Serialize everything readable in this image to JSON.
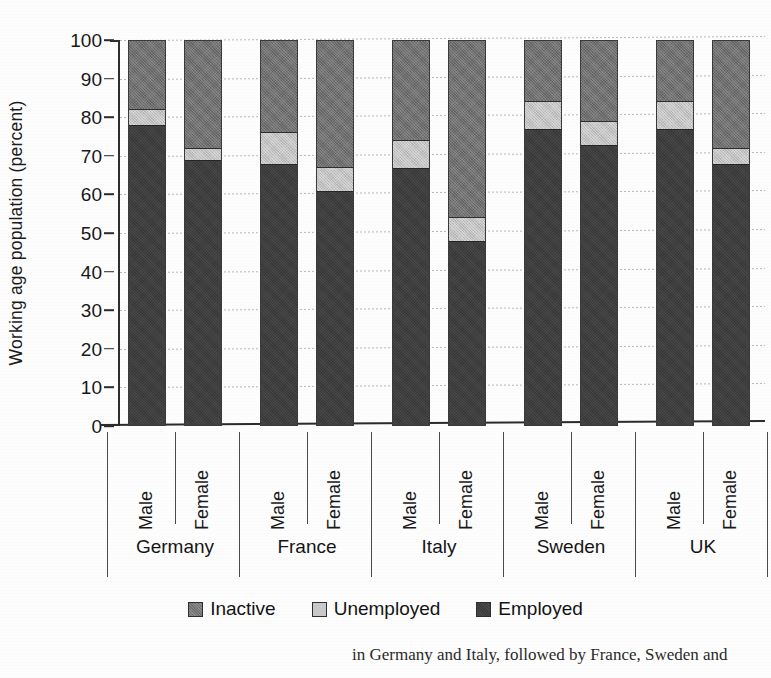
{
  "chart_data": {
    "type": "bar",
    "subtype": "stacked-100-percent",
    "title": "",
    "xlabel": "",
    "ylabel": "Working age population (percent)",
    "ylim": [
      0,
      100
    ],
    "ytick_values": [
      0,
      10,
      20,
      30,
      40,
      50,
      60,
      70,
      80,
      90,
      100
    ],
    "ytick_labels": [
      "0",
      "10",
      "20",
      "30",
      "40",
      "50",
      "60",
      "70",
      "80",
      "90",
      "100"
    ],
    "grid": true,
    "grid_axis": "y",
    "legend_position": "bottom",
    "groups": [
      "Germany",
      "France",
      "Italy",
      "Sweden",
      "UK"
    ],
    "subcategories": [
      "Male",
      "Female"
    ],
    "categories": [
      "Germany Male",
      "Germany Female",
      "France Male",
      "France Female",
      "Italy Male",
      "Italy Female",
      "Sweden Male",
      "Sweden Female",
      "UK Male",
      "UK Female"
    ],
    "series": [
      {
        "name": "Employed",
        "color": "#3d3d3d",
        "values": [
          78,
          69,
          68,
          61,
          67,
          48,
          77,
          73,
          77,
          68
        ]
      },
      {
        "name": "Unemployed",
        "color": "#c2c2c2",
        "values": [
          4,
          3,
          8,
          6,
          7,
          6,
          7,
          6,
          7,
          4
        ]
      },
      {
        "name": "Inactive",
        "color": "#707070",
        "values": [
          18,
          28,
          24,
          33,
          26,
          46,
          16,
          21,
          16,
          28
        ]
      }
    ],
    "bars": [
      {
        "group": "Germany",
        "sex": "Male",
        "employed": 78,
        "unemployed": 4,
        "inactive": 18
      },
      {
        "group": "Germany",
        "sex": "Female",
        "employed": 69,
        "unemployed": 3,
        "inactive": 28
      },
      {
        "group": "France",
        "sex": "Male",
        "employed": 68,
        "unemployed": 8,
        "inactive": 24
      },
      {
        "group": "France",
        "sex": "Female",
        "employed": 61,
        "unemployed": 6,
        "inactive": 33
      },
      {
        "group": "Italy",
        "sex": "Male",
        "employed": 67,
        "unemployed": 7,
        "inactive": 26
      },
      {
        "group": "Italy",
        "sex": "Female",
        "employed": 48,
        "unemployed": 6,
        "inactive": 46
      },
      {
        "group": "Sweden",
        "sex": "Male",
        "employed": 77,
        "unemployed": 7,
        "inactive": 16
      },
      {
        "group": "Sweden",
        "sex": "Female",
        "employed": 73,
        "unemployed": 6,
        "inactive": 21
      },
      {
        "group": "UK",
        "sex": "Male",
        "employed": 77,
        "unemployed": 7,
        "inactive": 16
      },
      {
        "group": "UK",
        "sex": "Female",
        "employed": 68,
        "unemployed": 4,
        "inactive": 28
      }
    ]
  },
  "legend": {
    "items": [
      {
        "label": "Inactive",
        "swatch": "inactive-swatch",
        "color": "#707070"
      },
      {
        "label": "Unemployed",
        "swatch": "unemployed-swatch",
        "color": "#c9c9c9"
      },
      {
        "label": "Employed",
        "swatch": "employed-swatch",
        "color": "#3b3b3b"
      }
    ]
  },
  "caption": {
    "text": "in Germany and Italy, followed by France, Sweden and"
  }
}
